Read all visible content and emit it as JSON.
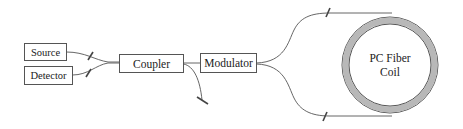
{
  "diagram": {
    "components": {
      "source": {
        "label": "Source"
      },
      "detector": {
        "label": "Detector"
      },
      "coupler": {
        "label": "Coupler"
      },
      "modulator": {
        "label": "Modulator"
      },
      "coil": {
        "label_line1": "PC Fiber",
        "label_line2": "Coil"
      }
    },
    "connections": [
      {
        "from": "source",
        "to": "coupler"
      },
      {
        "from": "detector",
        "to": "coupler"
      },
      {
        "from": "coupler",
        "to": "modulator"
      },
      {
        "from": "coupler",
        "to": "terminated-end"
      },
      {
        "from": "modulator",
        "to": "coil",
        "path": "top"
      },
      {
        "from": "modulator",
        "to": "coil",
        "path": "bottom"
      }
    ],
    "colors": {
      "line": "#555555",
      "ring_fill": "#b8b8b8",
      "background": "#ffffff"
    }
  }
}
